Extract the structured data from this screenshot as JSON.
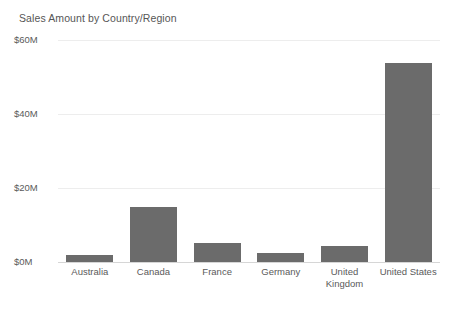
{
  "chart_data": {
    "type": "bar",
    "title": "Sales Amount by Country/Region",
    "xlabel": "",
    "ylabel": "",
    "categories": [
      "Australia",
      "Canada",
      "France",
      "Germany",
      "United Kingdom",
      "United States"
    ],
    "category_lines": [
      [
        "Australia"
      ],
      [
        "Canada"
      ],
      [
        "France"
      ],
      [
        "Germany"
      ],
      [
        "United",
        "Kingdom"
      ],
      [
        "United States"
      ]
    ],
    "values": [
      1.9,
      14.8,
      5.1,
      2.4,
      4.3,
      53.7
    ],
    "value_unit": "M",
    "ylim": [
      0,
      60
    ],
    "yticks": [
      0,
      20,
      40,
      60
    ],
    "ytick_labels": [
      "$0M",
      "$20M",
      "$40M",
      "$60M"
    ],
    "grid": true,
    "legend": false,
    "series": [
      {
        "name": "Sales Amount",
        "color": "#6b6b6b",
        "values": [
          1.9,
          14.8,
          5.1,
          2.4,
          4.3,
          53.7
        ]
      }
    ]
  },
  "colors": {
    "bar": "#6b6b6b",
    "gridline": "#ededed",
    "axis": "#d6d6d6",
    "text": "#5a5a5a",
    "title_text": "#565656",
    "background": "#ffffff"
  }
}
